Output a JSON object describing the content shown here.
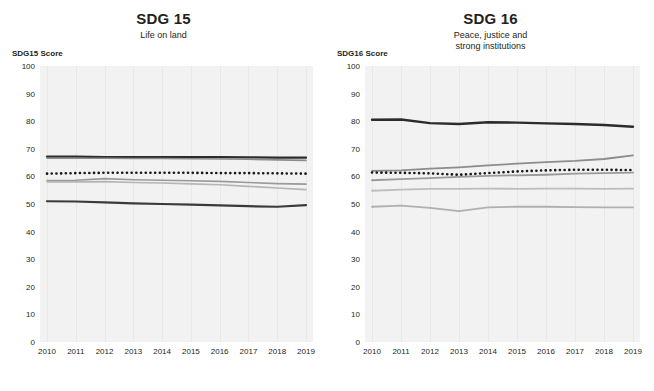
{
  "charts": [
    {
      "title": "SDG 15",
      "subtitle": "Life on land",
      "ylabel": "SDG15 Score"
    },
    {
      "title": "SDG 16",
      "subtitle": "Peace, justice and\nstrong institutions",
      "ylabel": "SDG16 Score"
    }
  ],
  "chart_data": [
    {
      "type": "line",
      "title": "SDG 15",
      "subtitle": "Life on land",
      "xlabel": "",
      "ylabel": "SDG15 Score",
      "x": [
        2010,
        2011,
        2012,
        2013,
        2014,
        2015,
        2016,
        2017,
        2018,
        2019
      ],
      "xtick_labels": [
        "2010",
        "2011",
        "2012",
        "2013",
        "2014",
        "2015",
        "2016",
        "2017",
        "2018",
        "2019"
      ],
      "ytick_labels": [
        "0",
        "10",
        "20",
        "30",
        "40",
        "50",
        "60",
        "70",
        "80",
        "90",
        "100"
      ],
      "ylim": [
        0,
        100
      ],
      "grid": true,
      "legend": "none",
      "series": [
        {
          "name": "series-dark-upper",
          "color": "#2b2b2b",
          "style": "solid",
          "width": 2.2,
          "values": [
            67.2,
            67.2,
            67.0,
            67.0,
            67.0,
            67.0,
            67.0,
            66.9,
            66.8,
            66.8
          ]
        },
        {
          "name": "series-gray-upper",
          "color": "#8c8c8c",
          "style": "solid",
          "width": 1.6,
          "values": [
            66.6,
            66.6,
            66.6,
            66.5,
            66.5,
            66.4,
            66.3,
            66.2,
            66.0,
            65.8
          ]
        },
        {
          "name": "series-dotted-reference",
          "color": "#1a1a1a",
          "style": "dotted",
          "width": 2.6,
          "values": [
            61.0,
            61.2,
            61.3,
            61.3,
            61.3,
            61.3,
            61.2,
            61.2,
            61.1,
            61.0
          ]
        },
        {
          "name": "series-midgray",
          "color": "#9a9a9a",
          "style": "solid",
          "width": 1.6,
          "values": [
            58.5,
            58.6,
            59.2,
            58.8,
            58.6,
            58.4,
            58.2,
            57.8,
            57.4,
            57.2
          ]
        },
        {
          "name": "series-lightgray",
          "color": "#b5b5b5",
          "style": "solid",
          "width": 1.6,
          "values": [
            58.0,
            58.0,
            58.1,
            57.8,
            57.6,
            57.3,
            57.0,
            56.4,
            55.8,
            55.2
          ]
        },
        {
          "name": "series-dark-lower",
          "color": "#3a3a3a",
          "style": "solid",
          "width": 2.2,
          "values": [
            51.0,
            50.9,
            50.6,
            50.2,
            50.0,
            49.8,
            49.5,
            49.2,
            49.0,
            49.6
          ]
        }
      ]
    },
    {
      "type": "line",
      "title": "SDG 16",
      "subtitle": "Peace, justice and strong institutions",
      "xlabel": "",
      "ylabel": "SDG16 Score",
      "x": [
        2010,
        2011,
        2012,
        2013,
        2014,
        2015,
        2016,
        2017,
        2018,
        2019
      ],
      "xtick_labels": [
        "2010",
        "2011",
        "2012",
        "2013",
        "2014",
        "2015",
        "2016",
        "2017",
        "2018",
        "2019"
      ],
      "ytick_labels": [
        "0",
        "10",
        "20",
        "30",
        "40",
        "50",
        "60",
        "70",
        "80",
        "90",
        "100"
      ],
      "ylim": [
        0,
        100
      ],
      "grid": true,
      "legend": "none",
      "series": [
        {
          "name": "series-dark-upper",
          "color": "#2b2b2b",
          "style": "solid",
          "width": 2.4,
          "values": [
            80.5,
            80.6,
            79.3,
            79.0,
            79.6,
            79.5,
            79.2,
            79.0,
            78.6,
            78.0
          ]
        },
        {
          "name": "series-gray-rising",
          "color": "#8c8c8c",
          "style": "solid",
          "width": 1.8,
          "values": [
            62.0,
            62.2,
            62.8,
            63.3,
            64.0,
            64.6,
            65.2,
            65.6,
            66.3,
            67.6
          ]
        },
        {
          "name": "series-dotted-reference",
          "color": "#1a1a1a",
          "style": "dotted",
          "width": 2.6,
          "values": [
            61.4,
            61.3,
            61.1,
            60.6,
            61.2,
            61.8,
            62.2,
            62.4,
            62.4,
            62.3
          ]
        },
        {
          "name": "series-midgray",
          "color": "#9a9a9a",
          "style": "solid",
          "width": 1.8,
          "values": [
            58.6,
            59.0,
            59.4,
            59.8,
            60.2,
            60.4,
            60.6,
            61.0,
            61.2,
            61.4
          ]
        },
        {
          "name": "series-lightgray",
          "color": "#bdbdbd",
          "style": "solid",
          "width": 1.8,
          "values": [
            54.8,
            55.2,
            55.5,
            55.5,
            55.6,
            55.5,
            55.6,
            55.6,
            55.5,
            55.6
          ]
        },
        {
          "name": "series-lowest",
          "color": "#b0b0b0",
          "style": "solid",
          "width": 1.8,
          "values": [
            49.0,
            49.4,
            48.6,
            47.4,
            48.8,
            49.0,
            49.0,
            48.9,
            48.8,
            48.8
          ]
        }
      ]
    }
  ]
}
